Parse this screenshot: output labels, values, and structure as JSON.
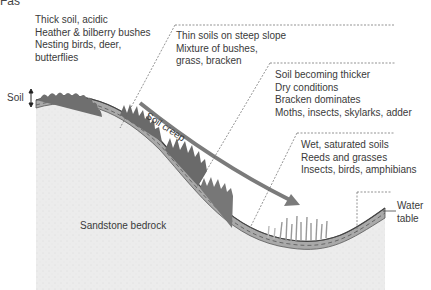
{
  "figure": {
    "label": "Fas",
    "type": "cross-section diagram",
    "colors": {
      "background": "#ffffff",
      "bedrock": "#ececec",
      "soil": "#a9a9a9",
      "soil_dark_edge": "#555555",
      "arrow": "#7b7b7b",
      "text": "#3a3a3a",
      "dashed_leader": "#666666"
    }
  },
  "zones": [
    {
      "id": "hilltop",
      "lines": [
        "Thick soil, acidic",
        "Heather & bilberry bushes",
        "Nesting birds, deer,",
        "butterflies"
      ]
    },
    {
      "id": "steep-slope",
      "lines": [
        "Thin soils on steep slope",
        "Mixture of bushes,",
        "grass, bracken"
      ]
    },
    {
      "id": "lower-slope",
      "lines": [
        "Soil becoming thicker",
        "Dry conditions",
        "Bracken dominates",
        "Moths, insects, skylarks, adder"
      ]
    },
    {
      "id": "valley-bottom",
      "lines": [
        "Wet, saturated soils",
        "Reeds and grasses",
        "Insects, birds, amphibians"
      ]
    }
  ],
  "labels": {
    "soil": "Soil",
    "soil_creep": "Soil creep",
    "bedrock": "Sandstone bedrock",
    "water_table_line1": "Water",
    "water_table_line2": "table"
  }
}
